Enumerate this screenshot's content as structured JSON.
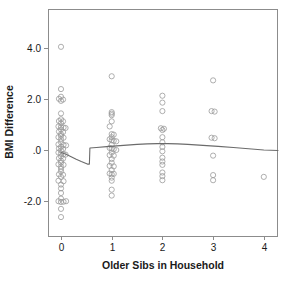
{
  "chart_data": {
    "type": "scatter",
    "title": "",
    "xlabel": "Older Sibs in Household",
    "ylabel": "BMI Difference",
    "xlim": [
      -0.25,
      4.3
    ],
    "ylim": [
      -2.9,
      4.9
    ],
    "xticks": [
      0,
      1,
      2,
      3,
      4
    ],
    "xtick_labels": [
      "0",
      "1",
      "2",
      "3",
      "4"
    ],
    "yticks": [
      4.0,
      2.0,
      0.0,
      -2.0
    ],
    "ytick_labels": [
      "4.0",
      "2.0",
      ".0",
      "-2.0"
    ],
    "grid": false,
    "legend": "none",
    "marker": "open-circle",
    "point_color": "#9a9a9a",
    "line_color": "#6b6b6b",
    "frame_color": "#8c8c8c",
    "series": [
      {
        "name": "BMI Difference observations",
        "points": [
          [
            0.0,
            4.03
          ],
          [
            0.0,
            2.38
          ],
          [
            0.0,
            2.08
          ],
          [
            -0.04,
            2.0
          ],
          [
            0.04,
            1.97
          ],
          [
            0.0,
            1.92
          ],
          [
            0.0,
            1.43
          ],
          [
            0.0,
            1.2
          ],
          [
            -0.04,
            1.13
          ],
          [
            0.04,
            1.12
          ],
          [
            0.0,
            1.05
          ],
          [
            -0.05,
            0.92
          ],
          [
            0.0,
            0.9
          ],
          [
            0.05,
            0.88
          ],
          [
            0.09,
            0.86
          ],
          [
            0.0,
            0.8
          ],
          [
            -0.04,
            0.72
          ],
          [
            0.04,
            0.7
          ],
          [
            0.0,
            0.62
          ],
          [
            0.0,
            0.55
          ],
          [
            -0.05,
            0.5
          ],
          [
            0.05,
            0.48
          ],
          [
            0.0,
            0.42
          ],
          [
            0.0,
            0.3
          ],
          [
            -0.05,
            0.22
          ],
          [
            0.05,
            0.2
          ],
          [
            0.1,
            0.18
          ],
          [
            0.0,
            0.12
          ],
          [
            -0.04,
            0.06
          ],
          [
            0.04,
            0.04
          ],
          [
            0.0,
            -0.02
          ],
          [
            -0.05,
            -0.1
          ],
          [
            0.0,
            -0.14
          ],
          [
            0.05,
            -0.16
          ],
          [
            0.09,
            -0.18
          ],
          [
            0.0,
            -0.25
          ],
          [
            -0.04,
            -0.32
          ],
          [
            0.04,
            -0.34
          ],
          [
            0.0,
            -0.42
          ],
          [
            0.0,
            -0.5
          ],
          [
            -0.05,
            -0.56
          ],
          [
            0.05,
            -0.58
          ],
          [
            0.0,
            -0.65
          ],
          [
            0.0,
            -0.74
          ],
          [
            0.0,
            -0.84
          ],
          [
            -0.04,
            -0.95
          ],
          [
            0.04,
            -0.97
          ],
          [
            0.0,
            -1.05
          ],
          [
            -0.05,
            -1.2
          ],
          [
            0.05,
            -1.22
          ],
          [
            0.0,
            -1.35
          ],
          [
            0.0,
            -1.5
          ],
          [
            0.0,
            -1.68
          ],
          [
            0.0,
            -1.9
          ],
          [
            -0.05,
            -2.0
          ],
          [
            0.0,
            -2.03
          ],
          [
            0.05,
            -2.02
          ],
          [
            0.1,
            -2.0
          ],
          [
            0.0,
            -2.3
          ],
          [
            0.0,
            -2.62
          ],
          [
            1.0,
            2.88
          ],
          [
            1.0,
            1.48
          ],
          [
            1.0,
            1.42
          ],
          [
            1.0,
            1.36
          ],
          [
            1.0,
            1.12
          ],
          [
            0.96,
            0.92
          ],
          [
            1.0,
            0.62
          ],
          [
            1.04,
            0.6
          ],
          [
            1.0,
            0.5
          ],
          [
            0.96,
            0.42
          ],
          [
            1.0,
            0.38
          ],
          [
            1.04,
            0.36
          ],
          [
            1.09,
            0.34
          ],
          [
            1.0,
            0.2
          ],
          [
            0.96,
            0.08
          ],
          [
            1.0,
            0.05
          ],
          [
            1.04,
            0.03
          ],
          [
            1.09,
            0.0
          ],
          [
            1.0,
            -0.1
          ],
          [
            0.96,
            -0.2
          ],
          [
            1.04,
            -0.22
          ],
          [
            1.0,
            -0.35
          ],
          [
            1.0,
            -0.5
          ],
          [
            0.96,
            -0.62
          ],
          [
            1.04,
            -0.64
          ],
          [
            1.0,
            -0.78
          ],
          [
            0.96,
            -0.92
          ],
          [
            1.0,
            -0.95
          ],
          [
            1.04,
            -0.93
          ],
          [
            1.0,
            -1.08
          ],
          [
            1.0,
            -1.2
          ],
          [
            1.0,
            -1.55
          ],
          [
            1.0,
            -1.78
          ],
          [
            2.0,
            2.12
          ],
          [
            2.0,
            1.85
          ],
          [
            2.0,
            1.52
          ],
          [
            1.97,
            0.85
          ],
          [
            2.03,
            0.83
          ],
          [
            2.0,
            0.78
          ],
          [
            2.0,
            0.5
          ],
          [
            2.0,
            0.3
          ],
          [
            2.0,
            0.12
          ],
          [
            2.0,
            -0.05
          ],
          [
            2.0,
            -0.3
          ],
          [
            2.0,
            -0.45
          ],
          [
            2.0,
            -0.58
          ],
          [
            2.0,
            -0.88
          ],
          [
            2.0,
            -1.02
          ],
          [
            2.0,
            -1.18
          ],
          [
            3.0,
            2.72
          ],
          [
            2.97,
            1.52
          ],
          [
            3.03,
            1.5
          ],
          [
            2.97,
            0.48
          ],
          [
            3.03,
            0.46
          ],
          [
            3.0,
            -0.22
          ],
          [
            3.0,
            -0.98
          ],
          [
            3.0,
            -1.18
          ],
          [
            4.0,
            -1.05
          ]
        ]
      }
    ],
    "fit_line": {
      "name": "fitted trend",
      "points": [
        [
          0.0,
          -0.1
        ],
        [
          0.1,
          -0.17
        ],
        [
          0.2,
          -0.26
        ],
        [
          0.3,
          -0.36
        ],
        [
          0.4,
          -0.45
        ],
        [
          0.52,
          -0.55
        ],
        [
          0.56,
          -0.55
        ],
        [
          0.57,
          0.08
        ],
        [
          0.7,
          0.1
        ],
        [
          0.9,
          0.13
        ],
        [
          1.1,
          0.16
        ],
        [
          1.3,
          0.19
        ],
        [
          1.5,
          0.22
        ],
        [
          1.7,
          0.24
        ],
        [
          1.9,
          0.25
        ],
        [
          2.1,
          0.25
        ],
        [
          2.3,
          0.24
        ],
        [
          2.5,
          0.22
        ],
        [
          2.8,
          0.18
        ],
        [
          3.1,
          0.14
        ],
        [
          3.4,
          0.1
        ],
        [
          3.7,
          0.05
        ],
        [
          4.0,
          0.0
        ],
        [
          4.28,
          -0.02
        ]
      ]
    }
  },
  "geometry": {
    "plot_left": 48,
    "plot_right": 277,
    "plot_top": 9,
    "plot_bottom": 236,
    "x_origin_px": 61,
    "x_unit_px": 50.7,
    "y_zero_px": 150,
    "y_unit_px": 25.6,
    "point_radius": 2.6
  }
}
